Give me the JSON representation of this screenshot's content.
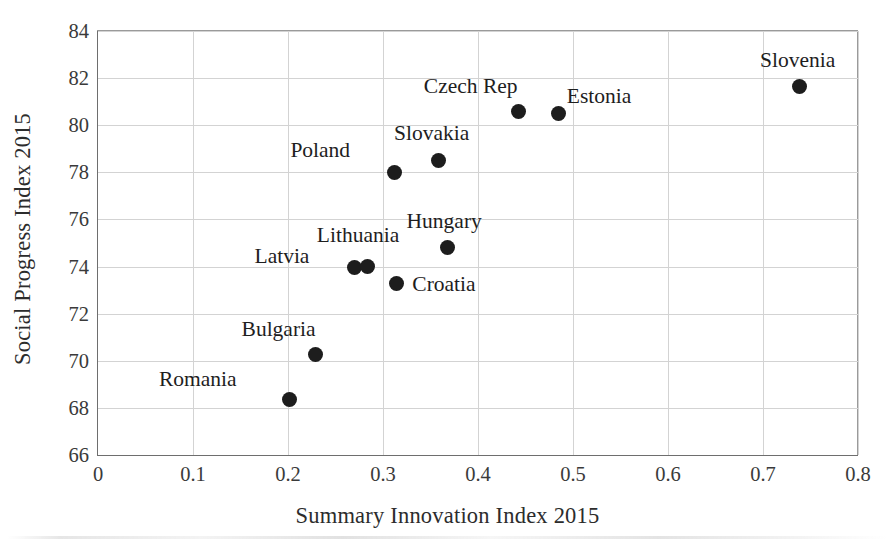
{
  "chart_data": {
    "type": "scatter",
    "title": "",
    "xlabel": "Summary Innovation Index 2015",
    "ylabel": "Social Progress Index 2015",
    "xlim": [
      0,
      0.8
    ],
    "ylim": [
      66,
      84
    ],
    "xticks": [
      "0",
      "0.1",
      "0.2",
      "0.3",
      "0.4",
      "0.5",
      "0.6",
      "0.7",
      "0.8"
    ],
    "xtick_values": [
      0,
      0.1,
      0.2,
      0.3,
      0.4,
      0.5,
      0.6,
      0.7,
      0.8
    ],
    "yticks": [
      "66",
      "68",
      "70",
      "72",
      "74",
      "76",
      "78",
      "80",
      "82",
      "84"
    ],
    "ytick_values": [
      66,
      68,
      70,
      72,
      74,
      76,
      78,
      80,
      82,
      84
    ],
    "grid": true,
    "legend": "none",
    "marker": {
      "shape": "circle",
      "color": "#1d1d1d",
      "size": 15
    },
    "points": [
      {
        "label": "Romania",
        "x": 0.202,
        "y": 68.35,
        "label_dx": -131,
        "label_dy": -31
      },
      {
        "label": "Bulgaria",
        "x": 0.229,
        "y": 70.25,
        "label_dx": -74,
        "label_dy": -36
      },
      {
        "label": "Latvia",
        "x": 0.27,
        "y": 73.95,
        "label_dx": -100,
        "label_dy": -22
      },
      {
        "label": "Lithuania",
        "x": 0.284,
        "y": 74.0,
        "label_dx": -51,
        "label_dy": -42
      },
      {
        "label": "Croatia",
        "x": 0.314,
        "y": 73.3,
        "label_dx": 16,
        "label_dy": -9
      },
      {
        "label": "Poland",
        "x": 0.312,
        "y": 78.0,
        "label_dx": -104,
        "label_dy": -32
      },
      {
        "label": "Slovakia",
        "x": 0.358,
        "y": 78.5,
        "label_dx": -44,
        "label_dy": -38
      },
      {
        "label": "Hungary",
        "x": 0.368,
        "y": 74.8,
        "label_dx": -41,
        "label_dy": -37
      },
      {
        "label": "Czech Rep",
        "x": 0.443,
        "y": 80.6,
        "label_dx": -95,
        "label_dy": -35
      },
      {
        "label": "Estonia",
        "x": 0.485,
        "y": 80.5,
        "label_dx": 8,
        "label_dy": -27
      },
      {
        "label": "Slovenia",
        "x": 0.738,
        "y": 81.65,
        "label_dx": -39,
        "label_dy": -36
      }
    ]
  }
}
